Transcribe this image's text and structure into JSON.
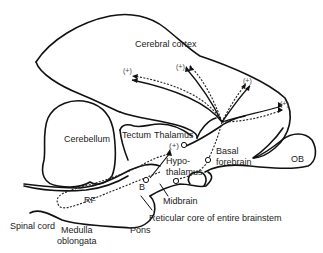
{
  "diagram": {
    "type": "brain-sagittal-schematic",
    "regions": {
      "cerebral_cortex": "Cerebral cortex",
      "cerebellum": "Cerebellum",
      "tectum": "Tectum",
      "thalamus": "Thalamus",
      "hypothalamus_1": "Hypo-",
      "hypothalamus_2": "thalamus",
      "basal_forebrain_1": "Basal",
      "basal_forebrain_2": "forebrain",
      "ob": "OB",
      "rf": "RF",
      "midbrain": "Midbrain",
      "reticular_core": "Reticular core of entire brainstem",
      "pons": "Pons",
      "spinal_cord": "Spinal cord",
      "medulla_1": "Medulla",
      "medulla_2": "oblongata"
    },
    "markers": {
      "plus": "(+)",
      "thalamus_plus": "(+)",
      "b": "B"
    },
    "colors": {
      "stroke": "#111111",
      "text": "#222222",
      "background": "#ffffff"
    }
  }
}
